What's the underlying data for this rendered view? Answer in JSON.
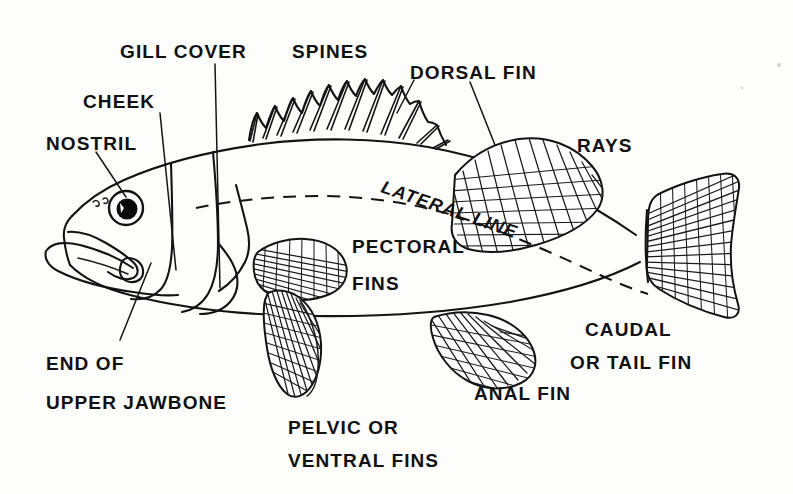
{
  "diagram": {
    "background_color": "#fdfdfc",
    "ink_color": "#131313"
  },
  "labels": {
    "nostril": "NOSTRIL",
    "cheek": "CHEEK",
    "gill_cover": "GILL COVER",
    "spines": "SPINES",
    "dorsal_fin": "DORSAL FIN",
    "rays": "RAYS",
    "lateral_line": "LATERAL LINE",
    "pectoral_fins_line1": "PECTORAL",
    "pectoral_fins_line2": "FINS",
    "end_of_upper_jawbone_line1": "END OF",
    "end_of_upper_jawbone_line2": "UPPER JAWBONE",
    "pelvic_fins_line1": "PELVIC OR",
    "pelvic_fins_line2": "VENTRAL FINS",
    "anal_fin": "ANAL FIN",
    "caudal_fin_line1": "CAUDAL",
    "caudal_fin_line2": "OR TAIL FIN"
  },
  "parts": {
    "spiny_dorsal_spine_count": 12,
    "soft_dorsal_ray_count": 12,
    "caudal_ray_count": 14,
    "pectoral_ray_count": 11,
    "pelvic_ray_count": 9,
    "anal_ray_count": 10
  }
}
